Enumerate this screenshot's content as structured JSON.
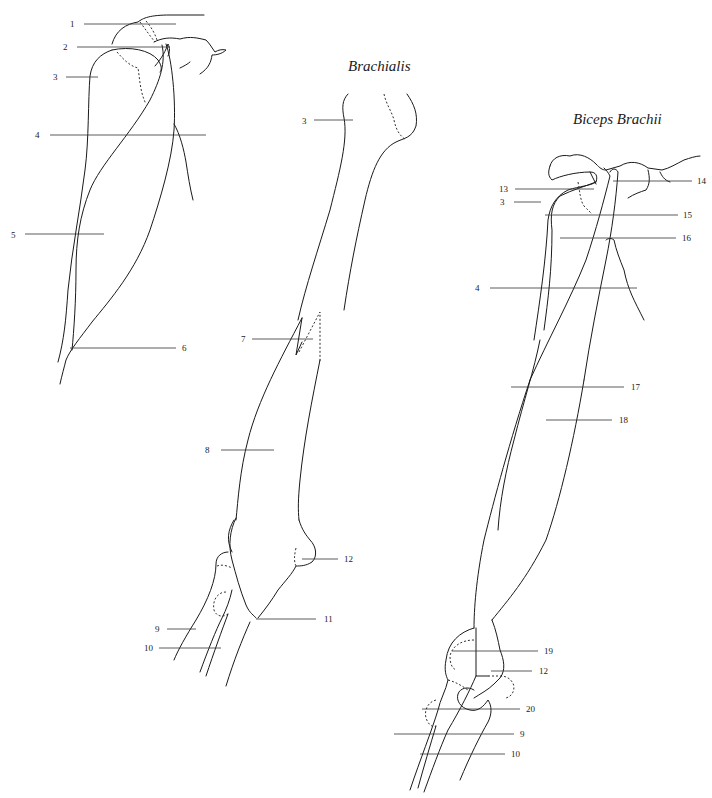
{
  "figures": [
    {
      "id": "shoulder-arm-lateral",
      "title": "",
      "labels": [
        {
          "n": "1",
          "x": 70,
          "y": 24,
          "x1": 84,
          "x2": 176,
          "ly": 24
        },
        {
          "n": "2",
          "x": 63,
          "y": 48,
          "x1": 77,
          "x2": 170,
          "ly": 47
        },
        {
          "n": "3",
          "x": 53,
          "y": 78,
          "x1": 66,
          "x2": 98,
          "ly": 77
        },
        {
          "n": "4",
          "x": 35,
          "y": 137,
          "x1": 50,
          "x2": 206,
          "ly": 135
        },
        {
          "n": "5",
          "x": 11,
          "y": 238,
          "x1": 25,
          "x2": 104,
          "ly": 234
        },
        {
          "n": "6",
          "x": 182,
          "y": 351,
          "x1": 70,
          "x2": 176,
          "ly": 348
        }
      ]
    },
    {
      "id": "brachialis",
      "title": "Brachialis",
      "labels": [
        {
          "n": "3",
          "x": 302,
          "y": 124,
          "x1": 314,
          "x2": 353,
          "ly": 120
        },
        {
          "n": "7",
          "x": 241,
          "y": 341,
          "x1": 252,
          "x2": 313,
          "ly": 339
        },
        {
          "n": "8",
          "x": 205,
          "y": 451,
          "x1": 221,
          "x2": 274,
          "ly": 450
        },
        {
          "n": "9",
          "x": 155,
          "y": 632,
          "x1": 167,
          "x2": 196,
          "ly": 629
        },
        {
          "n": "10",
          "x": 144,
          "y": 651,
          "x1": 159,
          "x2": 221,
          "ly": 648
        },
        {
          "n": "11",
          "x": 326,
          "y": 622,
          "x1": 256,
          "x2": 316,
          "ly": 619
        },
        {
          "n": "12",
          "x": 343,
          "y": 562,
          "x1": 302,
          "x2": 338,
          "ly": 559
        }
      ]
    },
    {
      "id": "biceps-brachii",
      "title": "Biceps Brachii",
      "labels": [
        {
          "n": "13",
          "x": 499,
          "y": 192,
          "x1": 515,
          "x2": 594,
          "ly": 189
        },
        {
          "n": "3",
          "x": 500,
          "y": 205,
          "x1": 514,
          "x2": 541,
          "ly": 202
        },
        {
          "n": "14",
          "x": 697,
          "y": 184,
          "x1": 613,
          "x2": 692,
          "ly": 181
        },
        {
          "n": "15",
          "x": 683,
          "y": 218,
          "x1": 545,
          "x2": 678,
          "ly": 215
        },
        {
          "n": "16",
          "x": 682,
          "y": 241,
          "x1": 560,
          "x2": 676,
          "ly": 238
        },
        {
          "n": "4",
          "x": 475,
          "y": 290,
          "x1": 490,
          "x2": 637,
          "ly": 288
        },
        {
          "n": "17",
          "x": 631,
          "y": 389,
          "x1": 511,
          "x2": 624,
          "ly": 387
        },
        {
          "n": "18",
          "x": 619,
          "y": 423,
          "x1": 546,
          "x2": 612,
          "ly": 420
        },
        {
          "n": "19",
          "x": 544,
          "y": 654,
          "x1": 452,
          "x2": 538,
          "ly": 651
        },
        {
          "n": "12",
          "x": 539,
          "y": 674,
          "x1": 491,
          "x2": 532,
          "ly": 671
        },
        {
          "n": "20",
          "x": 526,
          "y": 713,
          "x1": 422,
          "x2": 520,
          "ly": 709
        },
        {
          "n": "9",
          "x": 520,
          "y": 737,
          "x1": 394,
          "x2": 514,
          "ly": 734
        },
        {
          "n": "10",
          "x": 511,
          "y": 757,
          "x1": 420,
          "x2": 505,
          "ly": 754
        }
      ]
    }
  ],
  "titles": {
    "brachialis": "Brachialis",
    "biceps": "Biceps Brachii"
  },
  "colors": {
    "line": "#1a1a1a",
    "background": "#ffffff"
  }
}
